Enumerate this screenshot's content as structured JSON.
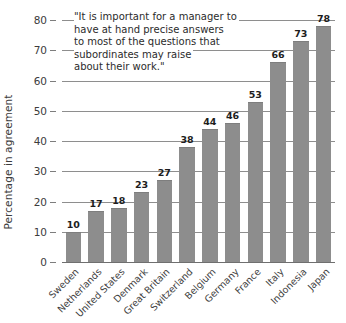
{
  "chart_data": {
    "type": "bar",
    "title": "",
    "subtitle": "",
    "xlabel": "",
    "ylabel": "Percentage in agreement",
    "ylim": [
      0,
      80
    ],
    "ytick_step": 10,
    "yticks": [
      "0",
      "10",
      "20",
      "30",
      "40",
      "50",
      "60",
      "70",
      "80"
    ],
    "grid": true,
    "legend": "none",
    "bar_color": "#8d8d8d",
    "categories": [
      "Sweden",
      "Netherlands",
      "United States",
      "Denmark",
      "Great Britain",
      "Switzerland",
      "Belgium",
      "Germany",
      "France",
      "Italy",
      "Indonesia",
      "Japan"
    ],
    "values": [
      10,
      17,
      18,
      23,
      27,
      38,
      44,
      46,
      53,
      66,
      73,
      78
    ],
    "value_labels": [
      "10",
      "17",
      "18",
      "23",
      "27",
      "38",
      "44",
      "46",
      "53",
      "66",
      "73",
      "78"
    ],
    "annotation": {
      "text": "\"It is important for a manager to have at hand precise answers to most of the questions that subordinates may raise about their work.\"",
      "lines": [
        "\"It is important for a manager to",
        "have at hand precise answers",
        "to most of the questions that",
        "subordinates may raise",
        "about their work.\""
      ]
    }
  }
}
